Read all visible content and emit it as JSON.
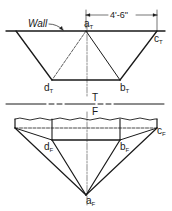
{
  "diagram": {
    "colors": {
      "ink": "#1a1a1a",
      "background": "#ffffff"
    },
    "top_view": {
      "wall_label": "Wall",
      "dimension": "4'-6\"",
      "points": {
        "a": {
          "base": "a",
          "sub": "T"
        },
        "b": {
          "base": "b",
          "sub": "T"
        },
        "c": {
          "base": "c",
          "sub": "T"
        },
        "d": {
          "base": "d",
          "sub": "T"
        }
      }
    },
    "fold_line": {
      "top_label": "T",
      "bottom_label": "F"
    },
    "front_view": {
      "points": {
        "a": {
          "base": "a",
          "sub": "F"
        },
        "b": {
          "base": "b",
          "sub": "F"
        },
        "c": {
          "base": "c",
          "sub": "F"
        },
        "d": {
          "base": "d",
          "sub": "F"
        }
      }
    }
  }
}
